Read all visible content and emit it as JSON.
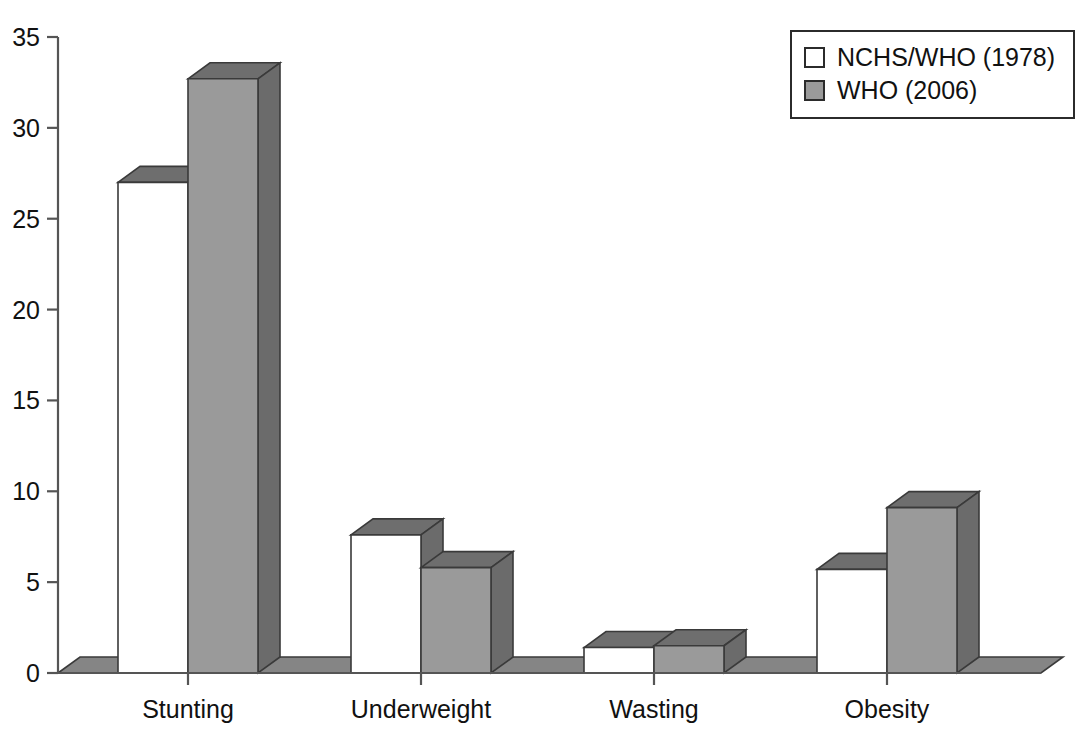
{
  "chart_data": {
    "type": "bar",
    "title": "",
    "subtitle": "",
    "xlabel": "",
    "ylabel": "",
    "categories": [
      "Stunting",
      "Underweight",
      "Wasting",
      "Obesity"
    ],
    "series": [
      {
        "name": "NCHS/WHO (1978)",
        "color": "#ffffff",
        "values": [
          27.0,
          7.6,
          1.4,
          5.7
        ]
      },
      {
        "name": "WHO (2006)",
        "color": "#9a9a9a",
        "values": [
          32.7,
          5.8,
          1.5,
          9.1
        ]
      }
    ],
    "ylim": [
      0,
      35
    ],
    "yticks": [
      0,
      5,
      10,
      15,
      20,
      25,
      30,
      35
    ],
    "ytick_labels": [
      "0",
      "5",
      "10",
      "15",
      "20",
      "25",
      "30",
      "35"
    ],
    "grid": false,
    "legend_position": "top-right",
    "style": "3d-grouped-bars",
    "annotations": []
  },
  "axis": {
    "y_tick_labels": [
      "35",
      "30",
      "25",
      "20",
      "15",
      "10",
      "5",
      "0"
    ],
    "x_category_labels": [
      "Stunting",
      "Underweight",
      "Wasting",
      "Obesity"
    ]
  },
  "legend": {
    "entries": [
      {
        "label": "NCHS/WHO (1978)",
        "swatch_color": "#ffffff"
      },
      {
        "label": "WHO (2006)",
        "swatch_color": "#9a9a9a"
      }
    ]
  },
  "colors": {
    "series_one_face": "#ffffff",
    "series_two_face": "#9a9a9a",
    "bar_top_shade": "#6e6e6e",
    "bar_side_shade": "#6b6b6b",
    "floor_plate": "#858585",
    "outline": "#3a3a3a",
    "axis": "#555555",
    "text": "#111111"
  }
}
